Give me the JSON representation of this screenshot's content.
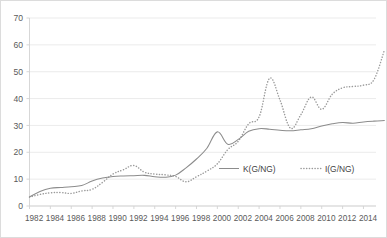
{
  "chart_data": {
    "type": "line",
    "title": "",
    "subtitle": "",
    "xlabel": "",
    "ylabel": "",
    "ylim": [
      0,
      70
    ],
    "ytick_labels": [
      "0",
      "10",
      "20",
      "30",
      "40",
      "50",
      "60",
      "70"
    ],
    "yticks": [
      0,
      10,
      20,
      30,
      40,
      50,
      60,
      70
    ],
    "grid": true,
    "legend_position": "center-right-inside",
    "x": [
      1982,
      1983,
      1984,
      1985,
      1986,
      1987,
      1988,
      1989,
      1990,
      1991,
      1992,
      1993,
      1994,
      1995,
      1996,
      1997,
      1998,
      1999,
      2000,
      2001,
      2002,
      2003,
      2004,
      2005,
      2006,
      2007,
      2008,
      2009,
      2010,
      2011,
      2012,
      2013,
      2014,
      2015
    ],
    "xtick_labels": [
      "1982",
      "1984",
      "1986",
      "1988",
      "1990",
      "1992",
      "1994",
      "1996",
      "1998",
      "2000",
      "2002",
      "2004",
      "2006",
      "2008",
      "2010",
      "2012",
      "2014"
    ],
    "xticks": [
      1982,
      1984,
      1986,
      1988,
      1990,
      1992,
      1994,
      1996,
      1998,
      2000,
      2002,
      2004,
      2006,
      2008,
      2010,
      2012,
      2014
    ],
    "series": [
      {
        "name": "K(G/NG)",
        "style": "solid",
        "color": "#8c8c8c",
        "values": [
          3.4,
          5.4,
          6.6,
          6.9,
          7.2,
          7.6,
          9.3,
          10.4,
          11.0,
          11.2,
          11.3,
          11.4,
          10.9,
          10.7,
          11.5,
          14.2,
          17.5,
          21.5,
          27.6,
          23.0,
          24.8,
          27.8,
          28.8,
          28.6,
          28.2,
          28.4,
          28.8,
          29.8,
          30.9,
          31.1,
          30.8,
          31.6,
          31.7,
          31.8
        ]
      },
      {
        "name": "I(G/NG)",
        "style": "dotted",
        "color": "#9a9a9a",
        "values": [
          3.3,
          4.3,
          4.9,
          5.0,
          4.7,
          5.6,
          6.2,
          8.8,
          11.9,
          13.5,
          15.1,
          12.6,
          11.9,
          11.6,
          11.0,
          9.0,
          10.9,
          13.0,
          15.7,
          21.0,
          24.1,
          30.6,
          33.2,
          32.8,
          30.3,
          27.8,
          31.1,
          37.1,
          38.3,
          36.7,
          41.5,
          44.9,
          47.5,
          47.0
        ]
      }
    ],
    "legend": [
      {
        "label": "K(G/NG)",
        "style": "solid"
      },
      {
        "label": "I(G/NG)",
        "style": "dotted"
      }
    ]
  },
  "series_extension": {
    "note_years": [
      2005,
      2006,
      2007,
      2008,
      2009,
      2010,
      2011,
      2012,
      2013,
      2014,
      2015,
      2016
    ],
    "i_tail": [
      47.5,
      39.5,
      29.0,
      34.0,
      40.6,
      36.0,
      41.6,
      44.0,
      44.5,
      45.0,
      47.0,
      58.0
    ],
    "k_tail": [
      28.6,
      28.2,
      28.0,
      28.4,
      28.8,
      29.8,
      30.6,
      31.1,
      30.8,
      31.3,
      31.6,
      31.8
    ]
  }
}
